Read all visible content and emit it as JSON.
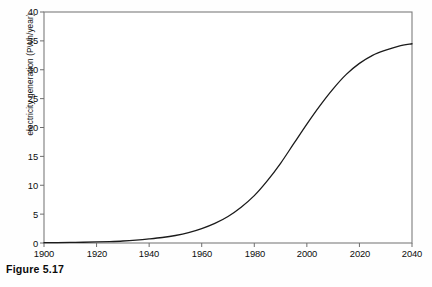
{
  "caption": "Figure 5.17",
  "chart_data": {
    "type": "line",
    "title": "",
    "subtitle": "",
    "xlabel": "",
    "ylabel": "electricity generation (PWh/year)",
    "xlim": [
      1900,
      2040
    ],
    "ylim": [
      0,
      40
    ],
    "xticks": [
      1900,
      1920,
      1940,
      1960,
      1980,
      2000,
      2020,
      2040
    ],
    "xtick_labels": [
      "1900",
      "1920",
      "1940",
      "1960",
      "1980",
      "2000",
      "2020",
      "2040"
    ],
    "yticks": [
      0,
      5,
      10,
      15,
      20,
      25,
      30,
      35,
      40
    ],
    "ytick_labels": [
      "0",
      "5",
      "10",
      "15",
      "20",
      "25",
      "30",
      "35",
      "40"
    ],
    "grid": false,
    "legend": null,
    "legend_position": "none",
    "frame": "full-box",
    "line_color": "#1b1b1b",
    "line_width": 1.3,
    "annotations": [],
    "series": [
      {
        "name": "electricity generation",
        "x": [
          1900,
          1905,
          1910,
          1915,
          1920,
          1925,
          1930,
          1935,
          1940,
          1945,
          1950,
          1955,
          1960,
          1965,
          1970,
          1975,
          1980,
          1985,
          1990,
          1995,
          2000,
          2005,
          2010,
          2015,
          2020,
          2025,
          2030,
          2035,
          2040
        ],
        "values": [
          0.05,
          0.07,
          0.1,
          0.13,
          0.18,
          0.25,
          0.35,
          0.5,
          0.7,
          0.95,
          1.3,
          1.8,
          2.5,
          3.4,
          4.6,
          6.2,
          8.2,
          10.8,
          13.8,
          17.2,
          20.6,
          23.8,
          26.7,
          29.2,
          31.1,
          32.5,
          33.4,
          34.1,
          34.5
        ]
      }
    ]
  }
}
